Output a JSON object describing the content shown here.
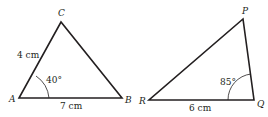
{
  "triangles": [
    {
      "vertices": {
        "A": {
          "label": "A",
          "x": 19,
          "y": 98
        },
        "B": {
          "label": "B",
          "x": 122,
          "y": 98
        },
        "C": {
          "label": "C",
          "x": 61,
          "y": 22
        }
      },
      "side_AC": "4 cm",
      "side_AB": "7 cm",
      "angle_A": "40°"
    },
    {
      "vertices": {
        "P": {
          "label": "P",
          "x": 243,
          "y": 19
        },
        "Q": {
          "label": "Q",
          "x": 254,
          "y": 100
        },
        "R": {
          "label": "R",
          "x": 149,
          "y": 100
        }
      },
      "side_RQ": "6 cm",
      "angle_Q": "85°"
    }
  ],
  "colors": {
    "line": "#231f20",
    "background": "#ffffff"
  }
}
